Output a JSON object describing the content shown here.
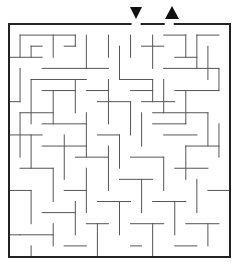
{
  "puzzle": {
    "type": "maze",
    "entrance_marker": "down-arrow",
    "exit_marker": "up-arrow",
    "wall_color": "#555555",
    "border_color": "#222222",
    "grid": {
      "origin_x": 9,
      "origin_y": 24,
      "cell": 11,
      "cols": 20,
      "rows": 21
    },
    "border": [
      [
        0,
        0,
        11,
        0
      ],
      [
        12,
        0,
        14,
        0
      ],
      [
        15,
        0,
        20,
        0
      ],
      [
        0,
        0,
        0,
        21
      ],
      [
        20,
        0,
        20,
        21
      ],
      [
        0,
        21,
        20,
        21
      ]
    ],
    "walls": [
      [
        1,
        1,
        6,
        1
      ],
      [
        1,
        1,
        1,
        3
      ],
      [
        2,
        2,
        3,
        2
      ],
      [
        2,
        2,
        2,
        3
      ],
      [
        0,
        3,
        3,
        3
      ],
      [
        4,
        1,
        4,
        3
      ],
      [
        6,
        1,
        6,
        2
      ],
      [
        5,
        2,
        6,
        2
      ],
      [
        7,
        1,
        7,
        4
      ],
      [
        3,
        4,
        9,
        4
      ],
      [
        9,
        1,
        9,
        3
      ],
      [
        10,
        2,
        10,
        5
      ],
      [
        11,
        1,
        11,
        3
      ],
      [
        13,
        1,
        13,
        4
      ],
      [
        12,
        2,
        14,
        2
      ],
      [
        14,
        1,
        16,
        1
      ],
      [
        16,
        1,
        16,
        3
      ],
      [
        17,
        1,
        19,
        1
      ],
      [
        17,
        1,
        17,
        4
      ],
      [
        18,
        2,
        18,
        5
      ],
      [
        15,
        3,
        17,
        3
      ],
      [
        14,
        4,
        19,
        4
      ],
      [
        19,
        4,
        19,
        6
      ],
      [
        1,
        4,
        1,
        7
      ],
      [
        0,
        7,
        1,
        7
      ],
      [
        2,
        5,
        7,
        5
      ],
      [
        2,
        5,
        2,
        9
      ],
      [
        3,
        6,
        6,
        6
      ],
      [
        6,
        5,
        6,
        8
      ],
      [
        4,
        6,
        4,
        9
      ],
      [
        7,
        6,
        9,
        6
      ],
      [
        9,
        5,
        9,
        9
      ],
      [
        10,
        5,
        13,
        5
      ],
      [
        11,
        6,
        13,
        6
      ],
      [
        13,
        5,
        13,
        7
      ],
      [
        14,
        5,
        14,
        8
      ],
      [
        15,
        6,
        19,
        6
      ],
      [
        16,
        6,
        16,
        9
      ],
      [
        12,
        7,
        15,
        7
      ],
      [
        1,
        8,
        4,
        8
      ],
      [
        1,
        8,
        1,
        12
      ],
      [
        3,
        9,
        7,
        9
      ],
      [
        7,
        8,
        7,
        12
      ],
      [
        8,
        7,
        11,
        7
      ],
      [
        11,
        7,
        11,
        10
      ],
      [
        12,
        8,
        12,
        11
      ],
      [
        13,
        8,
        18,
        8
      ],
      [
        18,
        8,
        18,
        11
      ],
      [
        0,
        10,
        3,
        10
      ],
      [
        2,
        10,
        2,
        13
      ],
      [
        5,
        10,
        5,
        14
      ],
      [
        8,
        10,
        10,
        10
      ],
      [
        10,
        10,
        10,
        13
      ],
      [
        13,
        9,
        16,
        9
      ],
      [
        14,
        10,
        17,
        10
      ],
      [
        19,
        9,
        19,
        12
      ],
      [
        3,
        11,
        7,
        11
      ],
      [
        6,
        12,
        9,
        12
      ],
      [
        9,
        11,
        9,
        15
      ],
      [
        11,
        12,
        14,
        12
      ],
      [
        14,
        12,
        14,
        15
      ],
      [
        16,
        11,
        19,
        11
      ],
      [
        16,
        11,
        16,
        14
      ],
      [
        1,
        13,
        4,
        13
      ],
      [
        4,
        13,
        4,
        16
      ],
      [
        7,
        13,
        7,
        17
      ],
      [
        0,
        15,
        2,
        15
      ],
      [
        2,
        15,
        2,
        18
      ],
      [
        5,
        15,
        7,
        15
      ],
      [
        10,
        14,
        13,
        14
      ],
      [
        12,
        14,
        12,
        17
      ],
      [
        15,
        13,
        18,
        13
      ],
      [
        17,
        14,
        17,
        17
      ],
      [
        18,
        15,
        20,
        15
      ],
      [
        3,
        17,
        6,
        17
      ],
      [
        6,
        16,
        6,
        19
      ],
      [
        8,
        16,
        11,
        16
      ],
      [
        10,
        16,
        10,
        19
      ],
      [
        13,
        16,
        16,
        16
      ],
      [
        15,
        16,
        15,
        19
      ],
      [
        1,
        19,
        4,
        19
      ],
      [
        4,
        18,
        4,
        20
      ],
      [
        0,
        19,
        1,
        19
      ],
      [
        7,
        18,
        9,
        18
      ],
      [
        8,
        18,
        8,
        21
      ],
      [
        11,
        18,
        14,
        18
      ],
      [
        13,
        18,
        13,
        21
      ],
      [
        16,
        18,
        19,
        18
      ],
      [
        18,
        18,
        18,
        20
      ],
      [
        2,
        20,
        2,
        21
      ],
      [
        5,
        20,
        7,
        20
      ],
      [
        11,
        20,
        12,
        20
      ],
      [
        15,
        20,
        17,
        20
      ]
    ]
  }
}
